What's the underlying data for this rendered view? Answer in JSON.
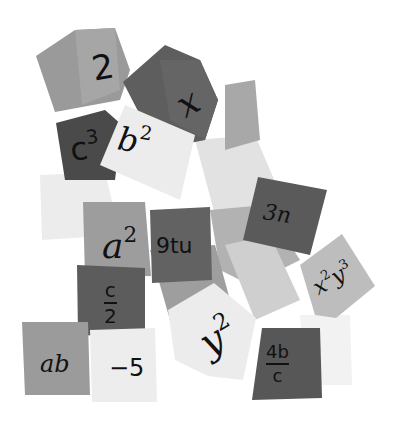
{
  "image": {
    "description": "Pile of grayscale cubes each labeled with an algebraic term",
    "width": 394,
    "height": 425,
    "background": "#ffffff"
  },
  "cubes": [
    {
      "id": "two",
      "label": "2",
      "shade": "#9a9a9a"
    },
    {
      "id": "x",
      "label": "x",
      "shade": "#5e5e5e"
    },
    {
      "id": "c3",
      "base": "c",
      "exp": "3",
      "shade": "#4a4a4a"
    },
    {
      "id": "b2",
      "base": "b",
      "exp": "2",
      "shade": "#ececec"
    },
    {
      "id": "a2",
      "base": "a",
      "exp": "2",
      "shade": "#9d9d9d"
    },
    {
      "id": "9tu",
      "label": "9tu",
      "shade": "#626262"
    },
    {
      "id": "3n",
      "label": "3n",
      "shade": "#5a5a5a"
    },
    {
      "id": "x2y3",
      "base1": "x",
      "exp1": "2",
      "base2": "y",
      "exp2": "3",
      "shade": "#bdbdbd"
    },
    {
      "id": "c-over-2",
      "numerator": "c",
      "denominator": "2",
      "shade": "#5c5c5c"
    },
    {
      "id": "y2",
      "base": "y",
      "exp": "2",
      "shade": "#ececec"
    },
    {
      "id": "ab",
      "label": "ab",
      "shade": "#9b9b9b"
    },
    {
      "id": "minus5",
      "label": "−5",
      "shade": "#ededed"
    },
    {
      "id": "4b-over-c",
      "numerator": "4b",
      "denominator": "c",
      "shade": "#575757"
    }
  ]
}
